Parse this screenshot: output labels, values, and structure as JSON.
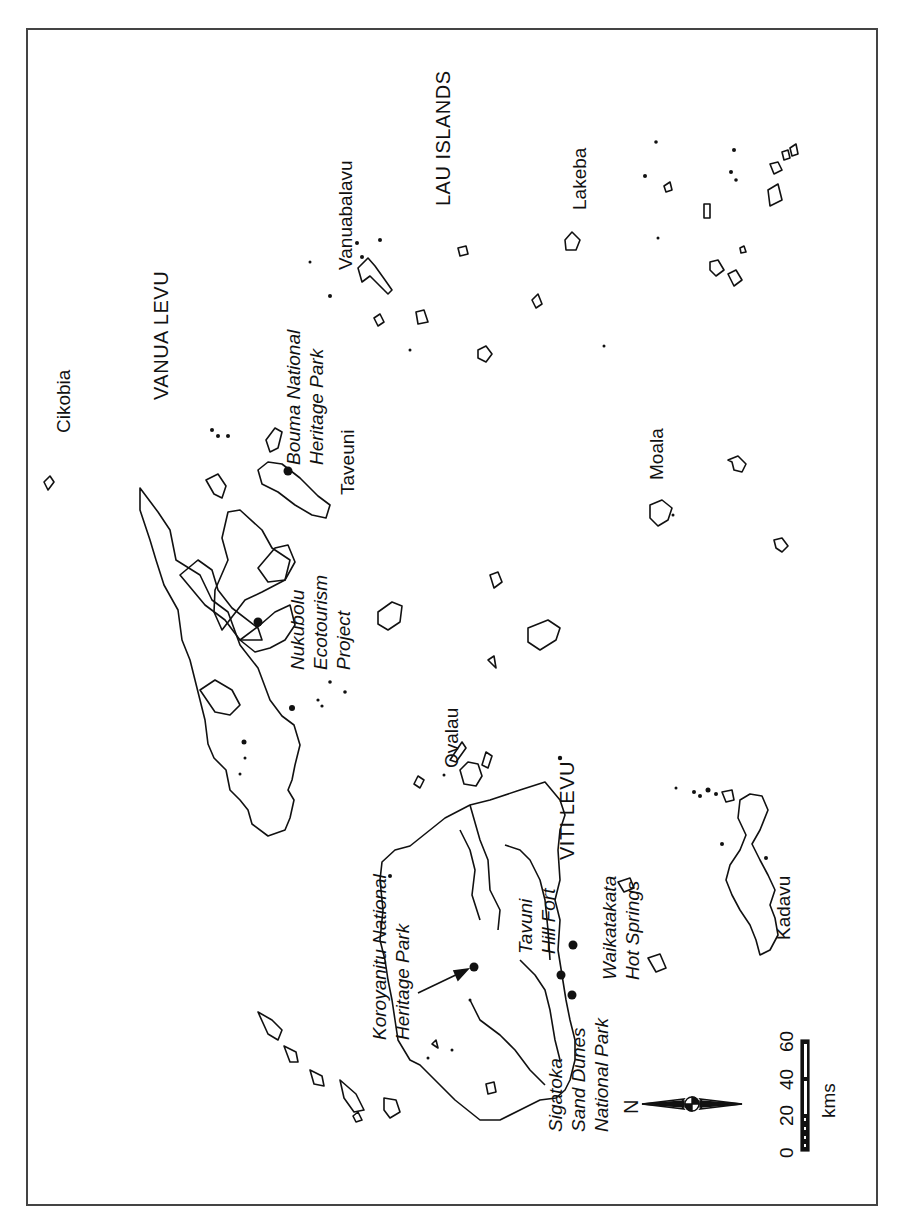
{
  "map": {
    "orientation": "rotated 90° counter-clockwise (north points left)",
    "regions": [
      {
        "id": "vanua-levu",
        "label": "VANUA LEVU",
        "x": 150,
        "y": 400
      },
      {
        "id": "viti-levu",
        "label": "VITI LEVU",
        "x": 556,
        "y": 860
      },
      {
        "id": "lau-islands",
        "label": "LAU ISLANDS",
        "x": 432,
        "y": 206
      }
    ],
    "islands": [
      {
        "id": "cikobia",
        "label": "Cikobia",
        "x": 52,
        "y": 433
      },
      {
        "id": "vanuabalavu",
        "label": "Vanuabalavu",
        "x": 334,
        "y": 270
      },
      {
        "id": "taveuni",
        "label": "Taveuni",
        "x": 336,
        "y": 495
      },
      {
        "id": "lakeba",
        "label": "Lakeba",
        "x": 568,
        "y": 210
      },
      {
        "id": "moala",
        "label": "Moala",
        "x": 645,
        "y": 480
      },
      {
        "id": "ovalau",
        "label": "Ovalau",
        "x": 440,
        "y": 768
      },
      {
        "id": "kadavu",
        "label": "Kadavu",
        "x": 772,
        "y": 940
      }
    ],
    "sites": [
      {
        "id": "bouma",
        "lines": [
          "Bouma National",
          "Heritage Park"
        ],
        "x": 282,
        "y": 465
      },
      {
        "id": "nukubolu",
        "lines": [
          "Nukubolu",
          "Ecotourism",
          "Project"
        ],
        "x": 286,
        "y": 670
      },
      {
        "id": "koroyanitu",
        "lines": [
          "Koroyanitu National",
          "Heritage Park"
        ],
        "x": 368,
        "y": 1040
      },
      {
        "id": "tavuni",
        "lines": [
          "Tavuni",
          "Hill Fort"
        ],
        "x": 514,
        "y": 954
      },
      {
        "id": "sigatoka",
        "lines": [
          "Sigatoka",
          "Sand Dunes",
          "National Park"
        ],
        "x": 544,
        "y": 1132
      },
      {
        "id": "waikatakata",
        "lines": [
          "Waikatakata",
          "Hot Springs"
        ],
        "x": 598,
        "y": 980
      }
    ],
    "north_arrow": {
      "label": "N"
    },
    "scale_bar": {
      "unit": "kms",
      "ticks": [
        "0",
        "20",
        "40",
        "60"
      ]
    },
    "colors": {
      "ink": "#111111",
      "frame": "#444444",
      "background": "#ffffff"
    }
  }
}
